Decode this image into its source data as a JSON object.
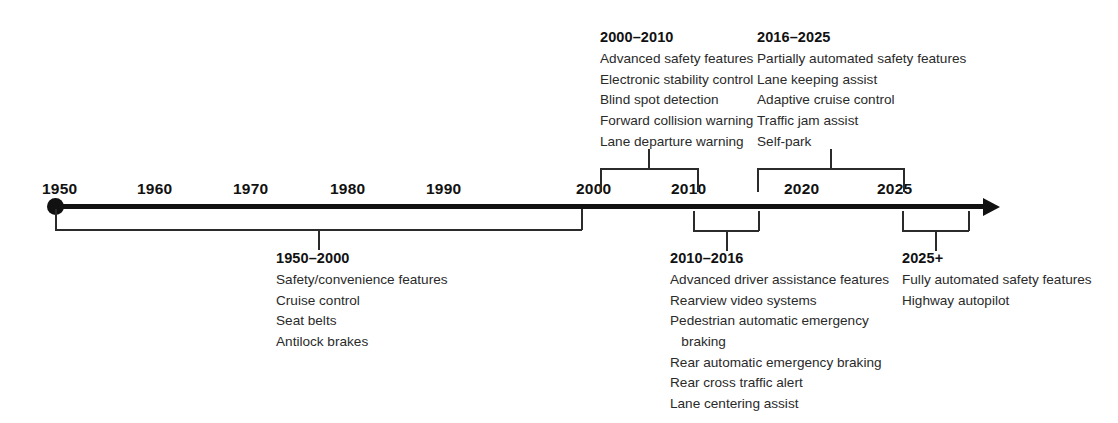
{
  "figure": {
    "axis": {
      "start_dot_year": "1950",
      "arrow_direction": "right",
      "tick_labels": [
        "1950",
        "1960",
        "1970",
        "1980",
        "1990",
        "2000",
        "2010",
        "2020",
        "2025"
      ]
    },
    "line_color": "#111111",
    "bracket_color": "#2b2b2b",
    "text_color": "#1a1a1a"
  },
  "eras": [
    {
      "id": "era-1950-2000",
      "title": "1950–2000",
      "position": "below",
      "items": [
        "Safety/convenience features",
        "Cruise control",
        "Seat belts",
        "Antilock brakes"
      ]
    },
    {
      "id": "era-2000-2010",
      "title": "2000–2010",
      "position": "above",
      "items": [
        "Advanced safety features",
        "Electronic stability control",
        "Blind spot detection",
        "Forward collision warning",
        "Lane departure warning"
      ]
    },
    {
      "id": "era-2010-2016",
      "title": "2010–2016",
      "position": "below",
      "items": [
        "Advanced driver assistance features",
        "Rearview video systems",
        "Pedestrian automatic emergency",
        "   braking",
        "Rear automatic emergency braking",
        "Rear cross traffic alert",
        "Lane centering assist"
      ]
    },
    {
      "id": "era-2016-2025",
      "title": "2016–2025",
      "position": "above",
      "items": [
        "Partially automated safety features",
        "Lane keeping assist",
        "Adaptive cruise control",
        "Traffic jam assist",
        "Self-park"
      ]
    },
    {
      "id": "era-2025-plus",
      "title": "2025+",
      "position": "below",
      "items": [
        "Fully automated safety features",
        "Highway autopilot"
      ]
    }
  ]
}
